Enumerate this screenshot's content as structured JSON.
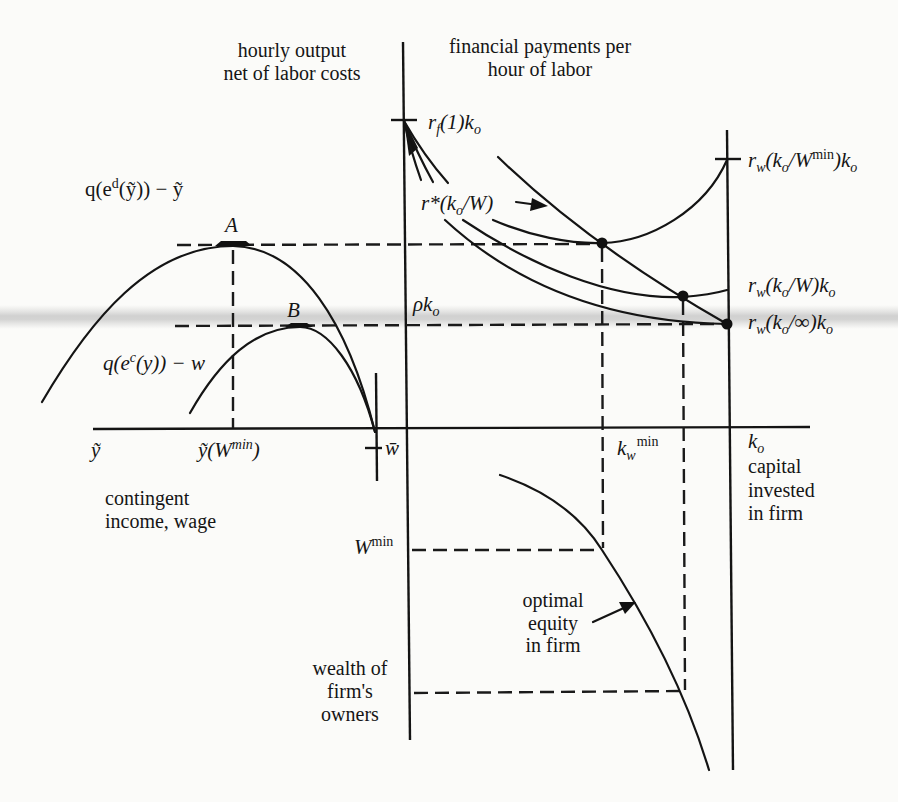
{
  "panels": {
    "net_output": {
      "title": [
        "hourly output",
        "net of labor costs"
      ]
    },
    "financial_payments": {
      "title": [
        "financial payments per",
        "hour of labor"
      ]
    },
    "contingent_income": {
      "title": [
        "contingent",
        "income, wage"
      ]
    },
    "capital_invested": {
      "symbol": {
        "base": "k",
        "sub": "o"
      },
      "title": [
        "capital",
        "invested",
        "in firm"
      ]
    },
    "owners_wealth": {
      "title": [
        "wealth of",
        "firm's",
        "owners"
      ]
    }
  },
  "curves": {
    "q_ed": {
      "p1": "q(e",
      "sup": "d",
      "p2": "(ỹ)) − ỹ"
    },
    "q_ec": {
      "p1": "q(e",
      "sup": "c",
      "p2": "(y)) − w"
    },
    "r_star": {
      "p1": "r*(k",
      "sub": "o",
      "p2": "/W)"
    },
    "optimal_equity": {
      "label": [
        "optimal",
        "equity",
        "in firm"
      ]
    }
  },
  "points": {
    "A": "A",
    "B": "B"
  },
  "axis_labels": {
    "y_tilde": "ỹ",
    "y_tilde_wmin": {
      "p1": "ỹ(W",
      "sup": "min",
      "p2": ")"
    },
    "w_bar": "w̄",
    "rf1ko": {
      "r": "r",
      "sub": "f",
      "p2": "(1)k",
      "sub2": "o"
    },
    "rw_wmin": {
      "r": "r",
      "sub": "w",
      "p2": "(k",
      "sub2": "o",
      "p3": "/W",
      "sup": "min",
      "p4": ")k",
      "sub3": "o"
    },
    "rw_w": {
      "r": "r",
      "sub": "w",
      "p2": "(k",
      "sub2": "o",
      "p3": "/W)k",
      "sub3": "o"
    },
    "rw_inf": {
      "r": "r",
      "sub": "w",
      "p2": "(k",
      "sub2": "o",
      "p3": "/∞)k",
      "sub3": "o"
    },
    "rho_ko": {
      "p1": "ρk",
      "sub": "o"
    },
    "kw_min": {
      "p1": "k",
      "sub": "w",
      "sup": "min"
    },
    "w_min": {
      "p1": "W",
      "sup": "min"
    }
  },
  "colors": {
    "ink": "#141414",
    "paper": "#fbfbf9",
    "scan_band": "#cfcfcf"
  }
}
